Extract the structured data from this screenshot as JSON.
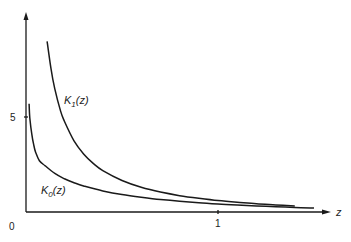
{
  "chart_data": {
    "type": "line",
    "title": "",
    "xlabel": "z",
    "ylabel": "",
    "origin_label": "0",
    "xticks": [
      {
        "value": 1,
        "label": "1"
      }
    ],
    "yticks": [
      {
        "value": 5,
        "label": "5"
      }
    ],
    "xlim": [
      0,
      1.55
    ],
    "ylim": [
      0,
      10.4
    ],
    "grid": false,
    "legend": "inline labels",
    "series": [
      {
        "name": "K1(z)",
        "label_main": "K",
        "label_sub": "1",
        "label_arg": "(z)",
        "x": [
          0.11,
          0.13,
          0.15,
          0.18,
          0.2,
          0.25,
          0.3,
          0.35,
          0.4,
          0.5,
          0.6,
          0.7,
          0.8,
          0.9,
          1.0,
          1.1,
          1.2,
          1.3,
          1.4
        ],
        "values": [
          8.98,
          7.55,
          6.48,
          5.31,
          4.78,
          3.75,
          3.06,
          2.56,
          2.18,
          1.66,
          1.3,
          1.05,
          0.86,
          0.72,
          0.6,
          0.51,
          0.43,
          0.37,
          0.32
        ]
      },
      {
        "name": "K0(z)",
        "label_main": "K",
        "label_sub": "0",
        "label_arg": "(z)",
        "x": [
          0.016,
          0.02,
          0.03,
          0.04,
          0.05,
          0.07,
          0.1,
          0.15,
          0.2,
          0.25,
          0.3,
          0.4,
          0.5,
          0.6,
          0.7,
          0.8,
          0.9,
          1.0,
          1.1,
          1.2,
          1.3,
          1.4,
          1.5
        ],
        "values": [
          5.7,
          4.95,
          4.1,
          3.55,
          3.15,
          2.7,
          2.43,
          2.03,
          1.75,
          1.54,
          1.37,
          1.11,
          0.92,
          0.78,
          0.66,
          0.57,
          0.49,
          0.42,
          0.37,
          0.32,
          0.28,
          0.24,
          0.21
        ]
      }
    ]
  },
  "colors": {
    "ink": "#1a1a1a",
    "background": "#ffffff"
  }
}
